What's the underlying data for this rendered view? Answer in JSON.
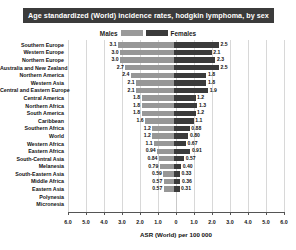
{
  "title": "Age standardized (World) incidence rates, hodgkin lymphoma, by sex",
  "legend": {
    "male_label": "Males",
    "female_label": "Females",
    "male_color": "#979797",
    "female_color": "#3b3b3b"
  },
  "axis": {
    "title": "ASR (World) per 100 000",
    "ticks": [
      "6.0",
      "5.0",
      "4.0",
      "3.0",
      "2.0",
      "1.0",
      "0",
      "1.0",
      "2.0",
      "3.0",
      "4.0",
      "5.0",
      "6.0"
    ]
  },
  "chart_data": {
    "type": "bar",
    "title": "Age standardized (World) incidence rates, hodgkin lymphoma, by sex",
    "xlabel": "ASR (World) per 100 000",
    "ylabel": "",
    "orientation": "horizontal-diverging",
    "xlim": [
      -6.0,
      6.0
    ],
    "grid": true,
    "legend_position": "top-center",
    "categories": [
      "Southern Europe",
      "Western Europe",
      "Northern Europe",
      "Australia and New Zealand",
      "Northern America",
      "Western Asia",
      "Central and Eastern Europe",
      "Central America",
      "Northern Africa",
      "South America",
      "Caribbean",
      "Southern Africa",
      "World",
      "Western Africa",
      "Eastern Africa",
      "South-Central Asia",
      "Melanesia",
      "South-Eastern Asia",
      "Middle Africa",
      "Eastern Asia",
      "Polynesia",
      "Micronesia"
    ],
    "series": [
      {
        "name": "Males",
        "direction": "left",
        "values": [
          3.1,
          3.0,
          3.0,
          2.7,
          2.4,
          2.1,
          2.1,
          1.8,
          1.8,
          1.8,
          1.6,
          1.2,
          1.2,
          1.1,
          0.94,
          0.84,
          0.79,
          0.59,
          0.57,
          0.57,
          0.0,
          0.0
        ],
        "labels": [
          "3.1",
          "3.0",
          "3.0",
          "2.7",
          "2.4",
          "2.1",
          "2.1",
          "1.8",
          "1.8",
          "1.8",
          "1.6",
          "1.2",
          "1.2",
          "1.1",
          "0.94",
          "0.84",
          "0.79",
          "0.59",
          "0.57",
          "0.57",
          "",
          ""
        ]
      },
      {
        "name": "Females",
        "direction": "right",
        "values": [
          2.5,
          2.1,
          2.3,
          2.5,
          1.8,
          1.8,
          1.9,
          1.2,
          1.3,
          1.2,
          1.1,
          0.88,
          0.8,
          0.67,
          0.91,
          0.57,
          0.4,
          0.33,
          0.36,
          0.31,
          0.0,
          0.0
        ],
        "labels": [
          "2.5",
          "2.1",
          "2.3",
          "2.5",
          "1.8",
          "1.8",
          "1.9",
          "1.2",
          "1.3",
          "1.2",
          "1.1",
          "0.88",
          "0.80",
          "0.67",
          "0.91",
          "0.57",
          "0.40",
          "0.33",
          "0.36",
          "0.31",
          "",
          ""
        ]
      }
    ]
  }
}
